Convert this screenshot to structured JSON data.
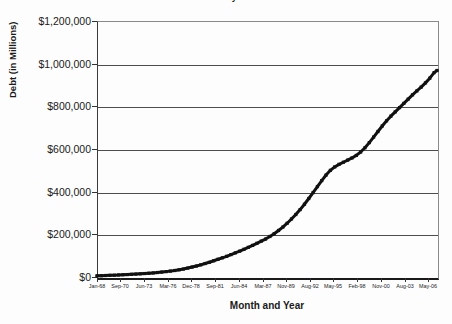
{
  "chart_data": {
    "type": "line",
    "title": "U.S. National Debt by Month and Year",
    "xlabel": "Month and Year",
    "ylabel": "Debt (in Millions)",
    "ylim": [
      0,
      1200000
    ],
    "ytick_labels": [
      "$0",
      "$200,000",
      "$400,000",
      "$600,000",
      "$800,000",
      "$1,000,000",
      "$1,200,000"
    ],
    "ytick_values": [
      0,
      200000,
      400000,
      600000,
      800000,
      1000000,
      1200000
    ],
    "grid": "horizontal",
    "legend": "none",
    "line_color": "#111111",
    "marker": "small-square",
    "categories": [
      "Jan-68",
      "Sep-70",
      "Jun-73",
      "Mar-76",
      "Dec-78",
      "Sep-81",
      "Jun-84",
      "Mar-87",
      "Nov-89",
      "Aug-92",
      "May-95",
      "Feb-98",
      "Nov-00",
      "Aug-03",
      "May-06"
    ],
    "xtick_values": [
      0,
      32,
      65,
      98,
      131,
      164,
      197,
      230,
      262,
      295,
      328,
      361,
      394,
      427,
      460
    ],
    "x_index_range": [
      0,
      472
    ],
    "series": [
      {
        "name": "Debt (in Millions)",
        "x": [
          0,
          6,
          12,
          18,
          24,
          30,
          36,
          42,
          48,
          54,
          60,
          66,
          72,
          78,
          84,
          90,
          96,
          102,
          108,
          114,
          120,
          126,
          132,
          138,
          144,
          150,
          156,
          162,
          168,
          174,
          180,
          186,
          192,
          198,
          204,
          210,
          216,
          222,
          228,
          234,
          240,
          246,
          252,
          258,
          264,
          270,
          276,
          282,
          288,
          294,
          300,
          306,
          312,
          318,
          324,
          330,
          336,
          342,
          348,
          354,
          360,
          366,
          372,
          378,
          384,
          390,
          396,
          402,
          408,
          414,
          420,
          426,
          432,
          438,
          444,
          450,
          456,
          462,
          468,
          472
        ],
        "values": [
          5500,
          6200,
          7000,
          7800,
          8600,
          9600,
          10500,
          11400,
          12500,
          13600,
          14800,
          16200,
          17600,
          19200,
          21000,
          23000,
          25200,
          27600,
          30500,
          33800,
          37500,
          41800,
          46500,
          51500,
          57000,
          63000,
          69000,
          76000,
          83000,
          90000,
          97000,
          105000,
          113000,
          121000,
          130000,
          139000,
          148000,
          158000,
          168000,
          178000,
          190000,
          203000,
          218000,
          234000,
          252000,
          272000,
          293000,
          316000,
          341000,
          368000,
          396000,
          424000,
          452000,
          478000,
          500000,
          516000,
          528000,
          538000,
          548000,
          558000,
          570000,
          586000,
          606000,
          630000,
          656000,
          682000,
          708000,
          732000,
          754000,
          774000,
          794000,
          814000,
          834000,
          854000,
          872000,
          890000,
          910000,
          932000,
          958000,
          968000
        ]
      }
    ]
  }
}
